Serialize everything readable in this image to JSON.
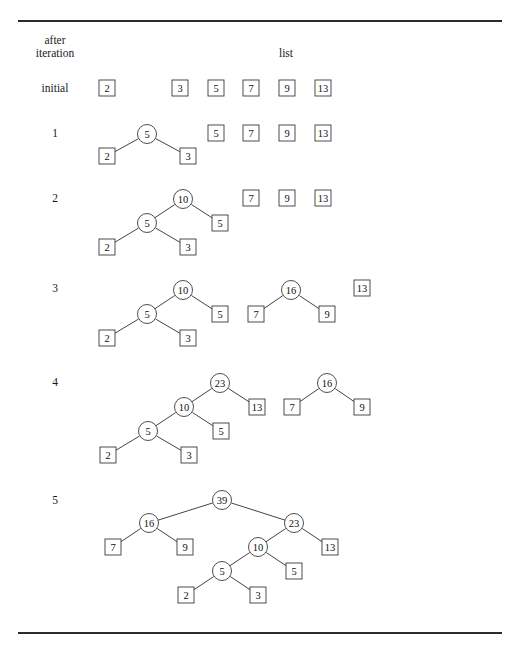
{
  "figure": {
    "headers": {
      "col1_line1": "after",
      "col1_line2": "iteration",
      "col2": "list"
    },
    "rules": [
      {
        "name": "top-rule",
        "x": 18,
        "y": 20,
        "width": 484,
        "height": 1.6
      },
      {
        "name": "bottom-rule",
        "x": 18,
        "y": 632,
        "width": 484,
        "height": 1.6
      }
    ],
    "header_positions": {
      "col1_line1_x": 55,
      "col1_line1_y": 40,
      "col1_line2_x": 55,
      "col1_line2_y": 53,
      "col2_x": 286,
      "col2_y": 53
    },
    "node_radius": 9.5,
    "box_size": 16,
    "rows": [
      {
        "label": "initial",
        "label_x": 55,
        "label_y": 88,
        "nodes": [
          {
            "value": "2",
            "shape": "box",
            "cx": 107,
            "cy": 88
          },
          {
            "value": "3",
            "shape": "box",
            "cx": 180,
            "cy": 88
          },
          {
            "value": "5",
            "shape": "box",
            "cx": 216,
            "cy": 88
          },
          {
            "value": "7",
            "shape": "box",
            "cx": 251,
            "cy": 88
          },
          {
            "value": "9",
            "shape": "box",
            "cx": 287,
            "cy": 88
          },
          {
            "value": "13",
            "shape": "box",
            "cx": 323,
            "cy": 88
          }
        ],
        "edges": []
      },
      {
        "label": "1",
        "label_x": 55,
        "label_y": 133,
        "nodes": [
          {
            "value": "5",
            "shape": "circle",
            "cx": 147,
            "cy": 134
          },
          {
            "value": "2",
            "shape": "box",
            "cx": 107,
            "cy": 156
          },
          {
            "value": "3",
            "shape": "box",
            "cx": 188,
            "cy": 156
          },
          {
            "value": "5",
            "shape": "box",
            "cx": 216,
            "cy": 133
          },
          {
            "value": "7",
            "shape": "box",
            "cx": 251,
            "cy": 133
          },
          {
            "value": "9",
            "shape": "box",
            "cx": 287,
            "cy": 133
          },
          {
            "value": "13",
            "shape": "box",
            "cx": 323,
            "cy": 133
          }
        ],
        "edges": [
          {
            "x1": 147,
            "y1": 134,
            "x2": 107,
            "y2": 156
          },
          {
            "x1": 147,
            "y1": 134,
            "x2": 188,
            "y2": 156
          }
        ]
      },
      {
        "label": "2",
        "label_x": 55,
        "label_y": 198,
        "nodes": [
          {
            "value": "10",
            "shape": "circle",
            "cx": 183,
            "cy": 199
          },
          {
            "value": "5",
            "shape": "circle",
            "cx": 147,
            "cy": 223
          },
          {
            "value": "5",
            "shape": "box",
            "cx": 220,
            "cy": 223
          },
          {
            "value": "2",
            "shape": "box",
            "cx": 107,
            "cy": 247
          },
          {
            "value": "3",
            "shape": "box",
            "cx": 188,
            "cy": 247
          },
          {
            "value": "7",
            "shape": "box",
            "cx": 251,
            "cy": 198
          },
          {
            "value": "9",
            "shape": "box",
            "cx": 287,
            "cy": 198
          },
          {
            "value": "13",
            "shape": "box",
            "cx": 323,
            "cy": 198
          }
        ],
        "edges": [
          {
            "x1": 183,
            "y1": 199,
            "x2": 147,
            "y2": 223
          },
          {
            "x1": 183,
            "y1": 199,
            "x2": 220,
            "y2": 223
          },
          {
            "x1": 147,
            "y1": 223,
            "x2": 107,
            "y2": 247
          },
          {
            "x1": 147,
            "y1": 223,
            "x2": 188,
            "y2": 247
          }
        ]
      },
      {
        "label": "3",
        "label_x": 55,
        "label_y": 288,
        "nodes": [
          {
            "value": "10",
            "shape": "circle",
            "cx": 183,
            "cy": 290
          },
          {
            "value": "5",
            "shape": "circle",
            "cx": 147,
            "cy": 314
          },
          {
            "value": "5",
            "shape": "box",
            "cx": 220,
            "cy": 314
          },
          {
            "value": "2",
            "shape": "box",
            "cx": 107,
            "cy": 338
          },
          {
            "value": "3",
            "shape": "box",
            "cx": 188,
            "cy": 338
          },
          {
            "value": "16",
            "shape": "circle",
            "cx": 291,
            "cy": 290
          },
          {
            "value": "7",
            "shape": "box",
            "cx": 256,
            "cy": 314
          },
          {
            "value": "9",
            "shape": "box",
            "cx": 327,
            "cy": 314
          },
          {
            "value": "13",
            "shape": "box",
            "cx": 362,
            "cy": 288
          }
        ],
        "edges": [
          {
            "x1": 183,
            "y1": 290,
            "x2": 147,
            "y2": 314
          },
          {
            "x1": 183,
            "y1": 290,
            "x2": 220,
            "y2": 314
          },
          {
            "x1": 147,
            "y1": 314,
            "x2": 107,
            "y2": 338
          },
          {
            "x1": 147,
            "y1": 314,
            "x2": 188,
            "y2": 338
          },
          {
            "x1": 291,
            "y1": 290,
            "x2": 256,
            "y2": 314
          },
          {
            "x1": 291,
            "y1": 290,
            "x2": 327,
            "y2": 314
          }
        ]
      },
      {
        "label": "4",
        "label_x": 55,
        "label_y": 382,
        "nodes": [
          {
            "value": "23",
            "shape": "circle",
            "cx": 220,
            "cy": 383
          },
          {
            "value": "10",
            "shape": "circle",
            "cx": 184,
            "cy": 407
          },
          {
            "value": "13",
            "shape": "box",
            "cx": 257,
            "cy": 407
          },
          {
            "value": "5",
            "shape": "circle",
            "cx": 148,
            "cy": 431
          },
          {
            "value": "5",
            "shape": "box",
            "cx": 221,
            "cy": 431
          },
          {
            "value": "2",
            "shape": "box",
            "cx": 108,
            "cy": 455
          },
          {
            "value": "3",
            "shape": "box",
            "cx": 189,
            "cy": 455
          },
          {
            "value": "16",
            "shape": "circle",
            "cx": 327,
            "cy": 383
          },
          {
            "value": "7",
            "shape": "box",
            "cx": 292,
            "cy": 407
          },
          {
            "value": "9",
            "shape": "box",
            "cx": 362,
            "cy": 407
          }
        ],
        "edges": [
          {
            "x1": 220,
            "y1": 383,
            "x2": 184,
            "y2": 407
          },
          {
            "x1": 220,
            "y1": 383,
            "x2": 257,
            "y2": 407
          },
          {
            "x1": 184,
            "y1": 407,
            "x2": 148,
            "y2": 431
          },
          {
            "x1": 184,
            "y1": 407,
            "x2": 221,
            "y2": 431
          },
          {
            "x1": 148,
            "y1": 431,
            "x2": 108,
            "y2": 455
          },
          {
            "x1": 148,
            "y1": 431,
            "x2": 189,
            "y2": 455
          },
          {
            "x1": 327,
            "y1": 383,
            "x2": 292,
            "y2": 407
          },
          {
            "x1": 327,
            "y1": 383,
            "x2": 362,
            "y2": 407
          }
        ]
      },
      {
        "label": "5",
        "label_x": 55,
        "label_y": 500,
        "nodes": [
          {
            "value": "39",
            "shape": "circle",
            "cx": 222,
            "cy": 500
          },
          {
            "value": "16",
            "shape": "circle",
            "cx": 149,
            "cy": 523
          },
          {
            "value": "23",
            "shape": "circle",
            "cx": 294,
            "cy": 523
          },
          {
            "value": "7",
            "shape": "box",
            "cx": 113,
            "cy": 547
          },
          {
            "value": "9",
            "shape": "box",
            "cx": 185,
            "cy": 547
          },
          {
            "value": "10",
            "shape": "circle",
            "cx": 258,
            "cy": 547
          },
          {
            "value": "13",
            "shape": "box",
            "cx": 330,
            "cy": 547
          },
          {
            "value": "5",
            "shape": "circle",
            "cx": 222,
            "cy": 571
          },
          {
            "value": "5",
            "shape": "box",
            "cx": 294,
            "cy": 571
          },
          {
            "value": "2",
            "shape": "box",
            "cx": 186,
            "cy": 595
          },
          {
            "value": "3",
            "shape": "box",
            "cx": 258,
            "cy": 595
          }
        ],
        "edges": [
          {
            "x1": 222,
            "y1": 500,
            "x2": 149,
            "y2": 523
          },
          {
            "x1": 222,
            "y1": 500,
            "x2": 294,
            "y2": 523
          },
          {
            "x1": 149,
            "y1": 523,
            "x2": 113,
            "y2": 547
          },
          {
            "x1": 149,
            "y1": 523,
            "x2": 185,
            "y2": 547
          },
          {
            "x1": 294,
            "y1": 523,
            "x2": 258,
            "y2": 547
          },
          {
            "x1": 294,
            "y1": 523,
            "x2": 330,
            "y2": 547
          },
          {
            "x1": 258,
            "y1": 547,
            "x2": 222,
            "y2": 571
          },
          {
            "x1": 258,
            "y1": 547,
            "x2": 294,
            "y2": 571
          },
          {
            "x1": 222,
            "y1": 571,
            "x2": 186,
            "y2": 595
          },
          {
            "x1": 222,
            "y1": 571,
            "x2": 258,
            "y2": 595
          }
        ]
      }
    ]
  }
}
